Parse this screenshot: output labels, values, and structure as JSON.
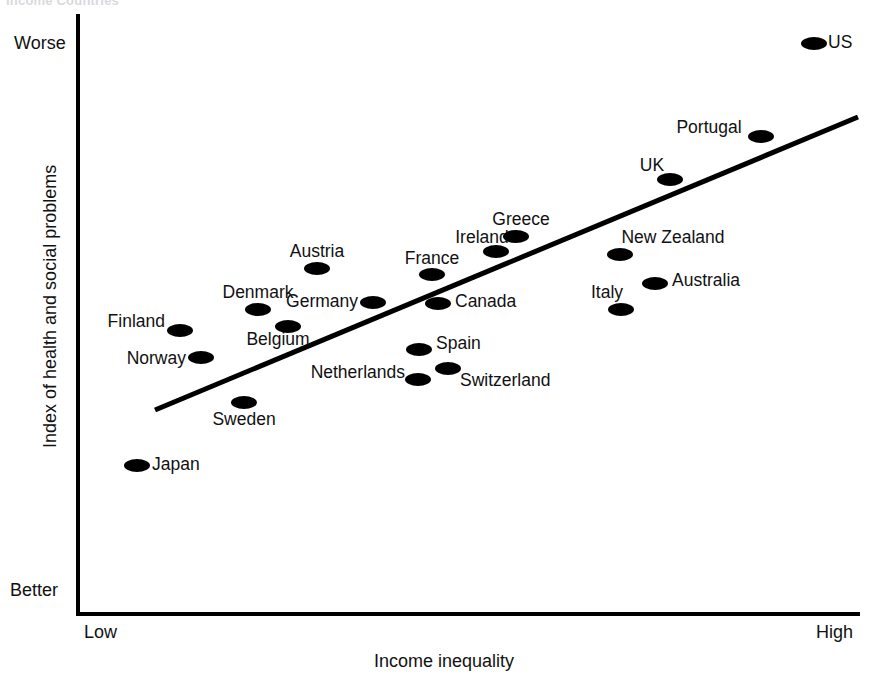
{
  "cut_title": "Income Countries",
  "axis": {
    "y_title": "Index of health and social problems",
    "y_top_label": "Worse",
    "y_bottom_label": "Better",
    "x_title": "Income inequality",
    "x_left_label": "Low",
    "x_right_label": "High"
  },
  "chart_data": {
    "type": "scatter",
    "title": "Income Countries",
    "xlabel": "Income inequality",
    "ylabel": "Index of health and social problems",
    "xlim": [
      "Low",
      "High"
    ],
    "ylim": [
      "Better",
      "Worse"
    ],
    "grid": false,
    "legend": null,
    "annotations": [
      "Worse",
      "Better",
      "Low",
      "High"
    ],
    "trendline": {
      "type": "linear-fit",
      "x_start_px": 155,
      "y_start_px": 410,
      "x_end_px": 858,
      "y_end_px": 117,
      "color": "#000000",
      "width_px": 5
    },
    "points": [
      {
        "name": "Japan",
        "px": 137,
        "py": 465,
        "label_x": 152,
        "label_y": 465,
        "anchor": "start"
      },
      {
        "name": "Norway",
        "px": 201,
        "py": 357,
        "label_x": 186,
        "label_y": 359,
        "anchor": "end"
      },
      {
        "name": "Finland",
        "px": 180,
        "py": 330,
        "label_x": 165,
        "label_y": 322,
        "anchor": "end"
      },
      {
        "name": "Sweden",
        "px": 244,
        "py": 402,
        "label_x": 244,
        "label_y": 420,
        "anchor": "mid"
      },
      {
        "name": "Denmark",
        "px": 258,
        "py": 309,
        "label_x": 258,
        "label_y": 293,
        "anchor": "mid"
      },
      {
        "name": "Belgium",
        "px": 288,
        "py": 326,
        "label_x": 278,
        "label_y": 340,
        "anchor": "mid"
      },
      {
        "name": "Austria",
        "px": 317,
        "py": 268,
        "label_x": 317,
        "label_y": 252,
        "anchor": "mid"
      },
      {
        "name": "Germany",
        "px": 373,
        "py": 302,
        "label_x": 358,
        "label_y": 302,
        "anchor": "end"
      },
      {
        "name": "Netherlands",
        "px": 418,
        "py": 379,
        "label_x": 405,
        "label_y": 373,
        "anchor": "end"
      },
      {
        "name": "Spain",
        "px": 419,
        "py": 349,
        "label_x": 436,
        "label_y": 344,
        "anchor": "start"
      },
      {
        "name": "Switzerland",
        "px": 448,
        "py": 368,
        "label_x": 460,
        "label_y": 381,
        "anchor": "start"
      },
      {
        "name": "France",
        "px": 432,
        "py": 274,
        "label_x": 432,
        "label_y": 259,
        "anchor": "mid"
      },
      {
        "name": "Canada",
        "px": 438,
        "py": 303,
        "label_x": 455,
        "label_y": 302,
        "anchor": "start"
      },
      {
        "name": "Ireland",
        "px": 496,
        "py": 251,
        "label_x": 482,
        "label_y": 238,
        "anchor": "mid"
      },
      {
        "name": "Greece",
        "px": 516,
        "py": 236,
        "label_x": 521,
        "label_y": 220,
        "anchor": "mid"
      },
      {
        "name": "Italy",
        "px": 621,
        "py": 309,
        "label_x": 607,
        "label_y": 293,
        "anchor": "mid"
      },
      {
        "name": "New Zealand",
        "px": 620,
        "py": 254,
        "label_x": 673,
        "label_y": 238,
        "anchor": "mid"
      },
      {
        "name": "Australia",
        "px": 655,
        "py": 283,
        "label_x": 672,
        "label_y": 281,
        "anchor": "start"
      },
      {
        "name": "UK",
        "px": 670,
        "py": 179,
        "label_x": 652,
        "label_y": 166,
        "anchor": "mid"
      },
      {
        "name": "Portugal",
        "px": 761,
        "py": 136,
        "label_x": 709,
        "label_y": 128,
        "anchor": "mid"
      },
      {
        "name": "US",
        "px": 814,
        "py": 43,
        "label_x": 828,
        "label_y": 43,
        "anchor": "start"
      }
    ]
  }
}
